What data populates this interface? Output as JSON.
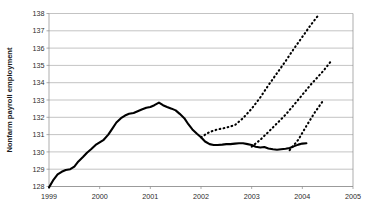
{
  "chart_data": {
    "type": "line",
    "title": "",
    "subtitle": "",
    "xlabel": "",
    "ylabel": "Nonfarm payroll employment",
    "xlim": [
      1999.0,
      2005.0
    ],
    "ylim": [
      128,
      138
    ],
    "grid": true,
    "grid_axis": "y",
    "legend": "none",
    "y_ticks": [
      128,
      129,
      130,
      131,
      132,
      133,
      134,
      135,
      136,
      137,
      138
    ],
    "y_tick_labels": [
      "128",
      "129",
      "130",
      "131",
      "132",
      "133",
      "134",
      "135",
      "136",
      "137",
      "138"
    ],
    "x_ticks": [
      1999,
      2000,
      2001,
      2002,
      2003,
      2004,
      2005
    ],
    "x_tick_labels": [
      "1999",
      "2000",
      "2001",
      "2002",
      "2003",
      "2004",
      "2005"
    ],
    "series": [
      {
        "name": "Actual nonfarm payroll employment",
        "style": "solid",
        "color": "#000000",
        "x": [
          1999.0,
          1999.08,
          1999.17,
          1999.25,
          1999.33,
          1999.42,
          1999.5,
          1999.58,
          1999.67,
          1999.75,
          1999.83,
          1999.92,
          2000.0,
          2000.08,
          2000.17,
          2000.25,
          2000.33,
          2000.42,
          2000.5,
          2000.58,
          2000.67,
          2000.75,
          2000.83,
          2000.92,
          2001.0,
          2001.08,
          2001.17,
          2001.25,
          2001.33,
          2001.42,
          2001.5,
          2001.58,
          2001.67,
          2001.75,
          2001.83,
          2001.92,
          2002.0,
          2002.08,
          2002.17,
          2002.25,
          2002.33,
          2002.42,
          2002.5,
          2002.58,
          2002.67,
          2002.75,
          2002.83,
          2002.92,
          2003.0,
          2003.08,
          2003.17,
          2003.25,
          2003.33,
          2003.42,
          2003.5,
          2003.58,
          2003.67,
          2003.75,
          2003.83,
          2003.92,
          2004.0,
          2004.08
        ],
        "y": [
          127.95,
          128.35,
          128.7,
          128.85,
          128.95,
          129.0,
          129.15,
          129.45,
          129.7,
          129.95,
          130.15,
          130.4,
          130.55,
          130.7,
          131.0,
          131.35,
          131.7,
          131.95,
          132.1,
          132.2,
          132.25,
          132.35,
          132.45,
          132.55,
          132.6,
          132.7,
          132.85,
          132.7,
          132.6,
          132.5,
          132.4,
          132.2,
          131.95,
          131.6,
          131.3,
          131.05,
          130.85,
          130.6,
          130.45,
          130.4,
          130.4,
          130.42,
          130.45,
          130.45,
          130.48,
          130.5,
          130.5,
          130.45,
          130.4,
          130.3,
          130.25,
          130.28,
          130.2,
          130.15,
          130.12,
          130.15,
          130.18,
          130.22,
          130.32,
          130.42,
          130.48,
          130.5
        ]
      },
      {
        "name": "Forecast vintage 1 (early 2002)",
        "style": "dashed",
        "color": "#000000",
        "x": [
          2002.0,
          2002.17,
          2002.33,
          2002.5,
          2002.67,
          2002.83,
          2003.0,
          2003.17,
          2003.33,
          2003.5,
          2003.67,
          2003.83,
          2004.0,
          2004.17,
          2004.33
        ],
        "y": [
          130.85,
          131.15,
          131.3,
          131.4,
          131.55,
          131.95,
          132.5,
          133.15,
          133.85,
          134.55,
          135.25,
          135.95,
          136.65,
          137.35,
          137.95
        ]
      },
      {
        "name": "Forecast vintage 2 (early 2003)",
        "style": "dashed",
        "color": "#000000",
        "x": [
          2003.0,
          2003.17,
          2003.33,
          2003.5,
          2003.67,
          2003.83,
          2004.0,
          2004.17,
          2004.42,
          2004.58
        ],
        "y": [
          130.3,
          130.7,
          131.15,
          131.65,
          132.15,
          132.7,
          133.3,
          133.9,
          134.7,
          135.3
        ]
      },
      {
        "name": "Forecast vintage 3 (late 2003)",
        "style": "dashed",
        "color": "#000000",
        "x": [
          2003.75,
          2003.92,
          2004.08,
          2004.25,
          2004.42
        ],
        "y": [
          130.1,
          130.7,
          131.5,
          132.3,
          133.0
        ]
      }
    ],
    "annotations": []
  },
  "axis": {
    "y_title": "Nonfarm payroll employment"
  }
}
